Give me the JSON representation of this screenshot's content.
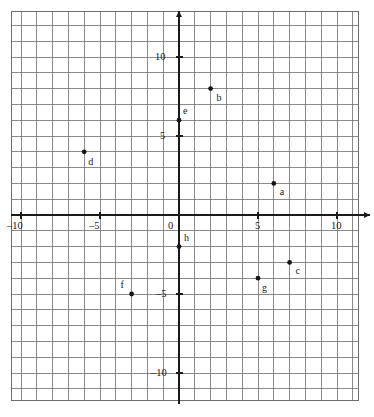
{
  "chart_data": {
    "type": "scatter",
    "title": "",
    "xlabel": "",
    "ylabel": "",
    "xlim": [
      -10.6,
      11.3
    ],
    "ylim": [
      -11.7,
      12.9
    ],
    "grid": true,
    "grid_step": 1,
    "legend": "none",
    "x_ticks": [
      -10,
      -5,
      0,
      5,
      10
    ],
    "y_ticks": [
      10,
      5,
      -5,
      -10
    ],
    "x_tick_labels": [
      "–10",
      "–5",
      "0",
      "5",
      "10"
    ],
    "y_tick_labels": [
      "10",
      "5",
      "–5",
      "–10"
    ],
    "points": [
      {
        "label": "a",
        "x": 6,
        "y": 2
      },
      {
        "label": "b",
        "x": 2,
        "y": 8
      },
      {
        "label": "c",
        "x": 7,
        "y": -3
      },
      {
        "label": "d",
        "x": -6,
        "y": 4
      },
      {
        "label": "e",
        "x": 0,
        "y": 6
      },
      {
        "label": "f",
        "x": -3,
        "y": -5
      },
      {
        "label": "g",
        "x": 5,
        "y": -4
      },
      {
        "label": "h",
        "x": 0,
        "y": -2
      }
    ]
  },
  "style": {
    "grid_color": "#6e6e6e",
    "axis_color": "#1a1a1a",
    "point_color": "#141414",
    "background": "#ffffff"
  },
  "geometry": {
    "origin_x": 179,
    "origin_y": 215,
    "unit_px": 15.8,
    "grid_left": 11,
    "grid_top": 11,
    "grid_right": 358,
    "grid_bottom": 400,
    "axis_x_start": 11,
    "axis_x_end": 370,
    "axis_y_start": 11,
    "axis_y_end": 404
  },
  "label_offsets": {
    "a": {
      "dx": 6,
      "dy": 4
    },
    "b": {
      "dx": 6,
      "dy": 4
    },
    "c": {
      "dx": 6,
      "dy": 4
    },
    "d": {
      "dx": 4,
      "dy": 5
    },
    "e": {
      "dx": 4,
      "dy": -14
    },
    "f": {
      "dx": -11,
      "dy": -14
    },
    "g": {
      "dx": 4,
      "dy": 5
    },
    "h": {
      "dx": 5,
      "dy": -14
    }
  },
  "tick_label_offsets": {
    "x": {
      "-10": {
        "dx": -14,
        "dy": 6
      },
      "-5": {
        "dx": -11,
        "dy": 6
      },
      "0": {
        "dx": -11,
        "dy": 6
      },
      "5": {
        "dx": -3,
        "dy": 6
      },
      "10": {
        "dx": -6,
        "dy": 6
      }
    },
    "y": {
      "10": {
        "dx": -24,
        "dy": -5
      },
      "5": {
        "dx": -19,
        "dy": -5
      },
      "-5": {
        "dx": -23,
        "dy": -5
      },
      "-10": {
        "dx": -28,
        "dy": -5
      }
    }
  }
}
